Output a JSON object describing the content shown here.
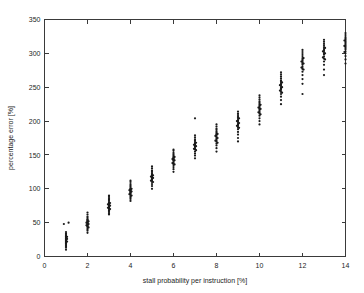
{
  "chart_data": {
    "type": "scatter",
    "title": "",
    "xlabel": "stall probability per instruction [%]",
    "ylabel": "percentage error [%]",
    "xlim": [
      0,
      14
    ],
    "ylim": [
      0,
      350
    ],
    "xticks": [
      0,
      2,
      4,
      6,
      8,
      10,
      12,
      14
    ],
    "yticks": [
      0,
      50,
      100,
      150,
      200,
      250,
      300,
      350
    ],
    "xtick_labels": [
      "0",
      "2",
      "4",
      "6",
      "8",
      "10",
      "12",
      "14"
    ],
    "ytick_labels": [
      "0",
      "50",
      "100",
      "150",
      "200",
      "250",
      "300",
      "350"
    ],
    "grid": false,
    "legend": null,
    "marker": "dot",
    "marker_color": "#1a1a1a",
    "marker_size": 1.1,
    "series": [
      {
        "name": "percentage error vs stall probability",
        "points": [
          [
            1.0,
            10
          ],
          [
            1.0,
            13
          ],
          [
            1.0,
            15
          ],
          [
            1.0,
            16
          ],
          [
            1.0,
            18
          ],
          [
            1.0,
            19
          ],
          [
            1.0,
            20
          ],
          [
            1.0,
            21
          ],
          [
            1.0,
            22
          ],
          [
            1.0,
            23
          ],
          [
            1.0,
            24
          ],
          [
            1.0,
            25
          ],
          [
            1.0,
            26
          ],
          [
            1.0,
            27
          ],
          [
            1.0,
            28
          ],
          [
            1.0,
            29
          ],
          [
            1.0,
            30
          ],
          [
            1.0,
            31
          ],
          [
            1.0,
            32
          ],
          [
            1.0,
            34
          ],
          [
            1.0,
            36
          ],
          [
            1.05,
            22
          ],
          [
            1.05,
            26
          ],
          [
            1.05,
            29
          ],
          [
            0.9,
            48
          ],
          [
            1.12,
            50
          ],
          [
            2.0,
            35
          ],
          [
            2.0,
            38
          ],
          [
            2.0,
            40
          ],
          [
            2.0,
            42
          ],
          [
            2.0,
            44
          ],
          [
            2.0,
            45
          ],
          [
            2.0,
            46
          ],
          [
            2.0,
            47
          ],
          [
            2.0,
            48
          ],
          [
            2.0,
            49
          ],
          [
            2.0,
            50
          ],
          [
            2.0,
            51
          ],
          [
            2.0,
            52
          ],
          [
            2.0,
            53
          ],
          [
            2.0,
            54
          ],
          [
            2.0,
            55
          ],
          [
            2.0,
            57
          ],
          [
            2.0,
            59
          ],
          [
            2.05,
            43
          ],
          [
            2.05,
            48
          ],
          [
            2.05,
            52
          ],
          [
            1.95,
            46
          ],
          [
            1.95,
            50
          ],
          [
            2.0,
            62
          ],
          [
            2.0,
            65
          ],
          [
            3.0,
            62
          ],
          [
            3.0,
            64
          ],
          [
            3.0,
            66
          ],
          [
            3.0,
            68
          ],
          [
            3.0,
            70
          ],
          [
            3.0,
            71
          ],
          [
            3.0,
            72
          ],
          [
            3.0,
            73
          ],
          [
            3.0,
            74
          ],
          [
            3.0,
            75
          ],
          [
            3.0,
            76
          ],
          [
            3.0,
            77
          ],
          [
            3.0,
            78
          ],
          [
            3.0,
            79
          ],
          [
            3.0,
            80
          ],
          [
            3.0,
            82
          ],
          [
            3.0,
            84
          ],
          [
            3.0,
            86
          ],
          [
            3.05,
            70
          ],
          [
            3.05,
            75
          ],
          [
            3.05,
            79
          ],
          [
            2.95,
            72
          ],
          [
            2.95,
            77
          ],
          [
            3.0,
            88
          ],
          [
            3.0,
            90
          ],
          [
            4.0,
            82
          ],
          [
            4.0,
            85
          ],
          [
            4.0,
            87
          ],
          [
            4.0,
            89
          ],
          [
            4.0,
            91
          ],
          [
            4.0,
            93
          ],
          [
            4.0,
            94
          ],
          [
            4.0,
            95
          ],
          [
            4.0,
            96
          ],
          [
            4.0,
            97
          ],
          [
            4.0,
            98
          ],
          [
            4.0,
            99
          ],
          [
            4.0,
            100
          ],
          [
            4.0,
            101
          ],
          [
            4.0,
            103
          ],
          [
            4.0,
            105
          ],
          [
            4.0,
            107
          ],
          [
            4.05,
            90
          ],
          [
            4.05,
            96
          ],
          [
            4.05,
            100
          ],
          [
            3.95,
            92
          ],
          [
            3.95,
            98
          ],
          [
            4.0,
            110
          ],
          [
            4.0,
            112
          ],
          [
            5.0,
            100
          ],
          [
            5.0,
            104
          ],
          [
            5.0,
            107
          ],
          [
            5.0,
            110
          ],
          [
            5.0,
            112
          ],
          [
            5.0,
            114
          ],
          [
            5.0,
            115
          ],
          [
            5.0,
            116
          ],
          [
            5.0,
            117
          ],
          [
            5.0,
            118
          ],
          [
            5.0,
            119
          ],
          [
            5.0,
            120
          ],
          [
            5.0,
            121
          ],
          [
            5.0,
            123
          ],
          [
            5.0,
            125
          ],
          [
            5.0,
            127
          ],
          [
            5.05,
            110
          ],
          [
            5.05,
            116
          ],
          [
            5.05,
            120
          ],
          [
            4.95,
            112
          ],
          [
            4.95,
            118
          ],
          [
            5.0,
            130
          ],
          [
            5.0,
            133
          ],
          [
            6.0,
            125
          ],
          [
            6.0,
            129
          ],
          [
            6.0,
            132
          ],
          [
            6.0,
            135
          ],
          [
            6.0,
            137
          ],
          [
            6.0,
            139
          ],
          [
            6.0,
            141
          ],
          [
            6.0,
            142
          ],
          [
            6.0,
            143
          ],
          [
            6.0,
            144
          ],
          [
            6.0,
            145
          ],
          [
            6.0,
            146
          ],
          [
            6.0,
            147
          ],
          [
            6.0,
            149
          ],
          [
            6.0,
            151
          ],
          [
            6.0,
            153
          ],
          [
            6.05,
            136
          ],
          [
            6.05,
            142
          ],
          [
            6.05,
            147
          ],
          [
            5.95,
            138
          ],
          [
            5.95,
            144
          ],
          [
            6.0,
            156
          ],
          [
            6.0,
            158
          ],
          [
            7.0,
            145
          ],
          [
            7.0,
            149
          ],
          [
            7.0,
            152
          ],
          [
            7.0,
            155
          ],
          [
            7.0,
            158
          ],
          [
            7.0,
            160
          ],
          [
            7.0,
            162
          ],
          [
            7.0,
            163
          ],
          [
            7.0,
            164
          ],
          [
            7.0,
            165
          ],
          [
            7.0,
            166
          ],
          [
            7.0,
            167
          ],
          [
            7.0,
            169
          ],
          [
            7.0,
            171
          ],
          [
            7.0,
            173
          ],
          [
            7.05,
            157
          ],
          [
            7.05,
            163
          ],
          [
            7.05,
            168
          ],
          [
            6.95,
            159
          ],
          [
            6.95,
            165
          ],
          [
            7.0,
            176
          ],
          [
            7.0,
            179
          ],
          [
            7.0,
            204
          ],
          [
            8.0,
            155
          ],
          [
            8.0,
            160
          ],
          [
            8.0,
            164
          ],
          [
            8.0,
            167
          ],
          [
            8.0,
            170
          ],
          [
            8.0,
            172
          ],
          [
            8.0,
            174
          ],
          [
            8.0,
            176
          ],
          [
            8.0,
            178
          ],
          [
            8.0,
            180
          ],
          [
            8.0,
            181
          ],
          [
            8.0,
            183
          ],
          [
            8.0,
            185
          ],
          [
            8.0,
            187
          ],
          [
            8.0,
            189
          ],
          [
            8.05,
            168
          ],
          [
            8.05,
            175
          ],
          [
            8.05,
            181
          ],
          [
            7.95,
            171
          ],
          [
            7.95,
            178
          ],
          [
            8.0,
            192
          ],
          [
            8.0,
            195
          ],
          [
            9.0,
            175
          ],
          [
            9.0,
            180
          ],
          [
            9.0,
            184
          ],
          [
            9.0,
            188
          ],
          [
            9.0,
            191
          ],
          [
            9.0,
            193
          ],
          [
            9.0,
            195
          ],
          [
            9.0,
            197
          ],
          [
            9.0,
            199
          ],
          [
            9.0,
            201
          ],
          [
            9.0,
            203
          ],
          [
            9.0,
            205
          ],
          [
            9.0,
            207
          ],
          [
            9.0,
            209
          ],
          [
            9.0,
            211
          ],
          [
            9.05,
            190
          ],
          [
            9.05,
            197
          ],
          [
            9.05,
            204
          ],
          [
            8.95,
            193
          ],
          [
            8.95,
            200
          ],
          [
            9.0,
            214
          ],
          [
            9.0,
            170
          ],
          [
            10.0,
            195
          ],
          [
            10.0,
            200
          ],
          [
            10.0,
            204
          ],
          [
            10.0,
            208
          ],
          [
            10.0,
            211
          ],
          [
            10.0,
            213
          ],
          [
            10.0,
            215
          ],
          [
            10.0,
            217
          ],
          [
            10.0,
            219
          ],
          [
            10.0,
            221
          ],
          [
            10.0,
            223
          ],
          [
            10.0,
            225
          ],
          [
            10.0,
            227
          ],
          [
            10.0,
            229
          ],
          [
            10.0,
            232
          ],
          [
            10.05,
            210
          ],
          [
            10.05,
            218
          ],
          [
            10.05,
            224
          ],
          [
            9.95,
            213
          ],
          [
            9.95,
            220
          ],
          [
            10.0,
            235
          ],
          [
            10.0,
            238
          ],
          [
            11.0,
            225
          ],
          [
            11.0,
            231
          ],
          [
            11.0,
            236
          ],
          [
            11.0,
            240
          ],
          [
            11.0,
            243
          ],
          [
            11.0,
            246
          ],
          [
            11.0,
            248
          ],
          [
            11.0,
            250
          ],
          [
            11.0,
            252
          ],
          [
            11.0,
            254
          ],
          [
            11.0,
            256
          ],
          [
            11.0,
            258
          ],
          [
            11.0,
            260
          ],
          [
            11.0,
            263
          ],
          [
            11.0,
            266
          ],
          [
            11.05,
            242
          ],
          [
            11.05,
            250
          ],
          [
            11.05,
            257
          ],
          [
            10.95,
            245
          ],
          [
            10.95,
            253
          ],
          [
            11.0,
            269
          ],
          [
            11.0,
            272
          ],
          [
            12.0,
            255
          ],
          [
            12.0,
            262
          ],
          [
            12.0,
            268
          ],
          [
            12.0,
            273
          ],
          [
            12.0,
            277
          ],
          [
            12.0,
            280
          ],
          [
            12.0,
            283
          ],
          [
            12.0,
            285
          ],
          [
            12.0,
            287
          ],
          [
            12.0,
            289
          ],
          [
            12.0,
            291
          ],
          [
            12.0,
            293
          ],
          [
            12.0,
            296
          ],
          [
            12.0,
            299
          ],
          [
            12.0,
            302
          ],
          [
            12.05,
            276
          ],
          [
            12.05,
            285
          ],
          [
            12.05,
            293
          ],
          [
            11.95,
            279
          ],
          [
            11.95,
            288
          ],
          [
            12.0,
            305
          ],
          [
            12.0,
            240
          ],
          [
            13.0,
            268
          ],
          [
            13.0,
            276
          ],
          [
            13.0,
            283
          ],
          [
            13.0,
            288
          ],
          [
            13.0,
            292
          ],
          [
            13.0,
            295
          ],
          [
            13.0,
            298
          ],
          [
            13.0,
            300
          ],
          [
            13.0,
            302
          ],
          [
            13.0,
            304
          ],
          [
            13.0,
            306
          ],
          [
            13.0,
            308
          ],
          [
            13.0,
            311
          ],
          [
            13.0,
            314
          ],
          [
            13.0,
            317
          ],
          [
            13.05,
            291
          ],
          [
            13.05,
            300
          ],
          [
            13.05,
            308
          ],
          [
            12.95,
            294
          ],
          [
            12.95,
            303
          ],
          [
            13.0,
            320
          ],
          [
            14.0,
            285
          ],
          [
            14.0,
            291
          ],
          [
            14.0,
            296
          ],
          [
            14.0,
            300
          ],
          [
            14.0,
            303
          ],
          [
            14.0,
            306
          ],
          [
            14.0,
            308
          ],
          [
            14.0,
            310
          ],
          [
            14.0,
            312
          ],
          [
            14.0,
            314
          ],
          [
            14.0,
            316
          ],
          [
            14.0,
            318
          ],
          [
            14.0,
            320
          ],
          [
            14.0,
            322
          ],
          [
            14.0,
            324
          ],
          [
            13.95,
            302
          ],
          [
            13.95,
            311
          ],
          [
            13.95,
            319
          ],
          [
            14.0,
            327
          ],
          [
            14.0,
            330
          ]
        ]
      }
    ]
  }
}
